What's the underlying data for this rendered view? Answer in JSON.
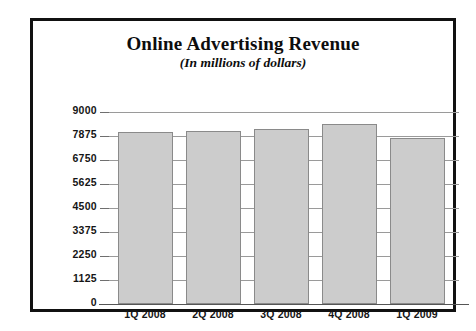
{
  "chart_data": {
    "type": "bar",
    "title": "Online Advertising Revenue",
    "subtitle": "(In millions of dollars)",
    "xlabel": "",
    "ylabel": "",
    "categories": [
      "1Q 2008",
      "2Q 2008",
      "3Q 2008",
      "4Q 2008",
      "1Q 2009"
    ],
    "values": [
      8060,
      8110,
      8200,
      8440,
      7780
    ],
    "series": [
      {
        "name": "Online Advertising Revenue",
        "values": [
          8060,
          8110,
          8200,
          8440,
          7780
        ]
      }
    ],
    "ylim": [
      0,
      9000
    ],
    "yticks": [
      0,
      1125,
      2250,
      3375,
      4500,
      5625,
      6750,
      7875,
      9000
    ],
    "ytick_labels": [
      "0",
      "1125",
      "2250",
      "3375",
      "4500",
      "5625",
      "6750",
      "7875",
      "9000"
    ],
    "grid": true,
    "grid_axis": "y",
    "legend": false,
    "legend_position": "none",
    "bar_fill_color": "#cccccc",
    "bar_edge_color": "#8a8a8a",
    "gridline_color": "#9a9a9a",
    "frame_color": "#111111",
    "background_color": "#ffffff",
    "text_color": "#151515"
  }
}
